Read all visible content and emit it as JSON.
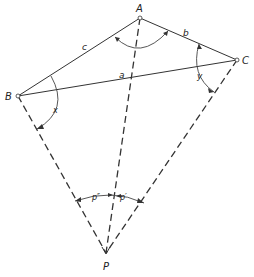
{
  "diagram": {
    "points": {
      "A": {
        "label": "A",
        "x": 140,
        "y": 18
      },
      "B": {
        "label": "B",
        "x": 18,
        "y": 96
      },
      "C": {
        "label": "C",
        "x": 237,
        "y": 60
      },
      "P": {
        "label": "P",
        "x": 106,
        "y": 253
      }
    },
    "sides": {
      "a": {
        "label": "a",
        "from": "B",
        "to": "C"
      },
      "b": {
        "label": "b",
        "from": "A",
        "to": "C"
      },
      "c": {
        "label": "c",
        "from": "A",
        "to": "B"
      }
    },
    "sight_lines": [
      "P-A",
      "P-B",
      "P-C"
    ],
    "angles": {
      "at_A": {
        "label": ""
      },
      "at_B": {
        "label": "x"
      },
      "at_C": {
        "label": "y"
      },
      "at_P_left": {
        "label": "p″"
      },
      "at_P_right": {
        "label": "p′"
      }
    }
  }
}
